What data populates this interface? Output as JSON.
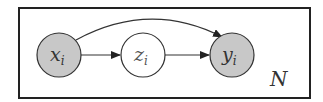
{
  "diagram": {
    "type": "plate-notation",
    "plate": {
      "label": "N"
    },
    "nodes": [
      {
        "id": "x",
        "label": "x",
        "subscript": "i",
        "observed": true
      },
      {
        "id": "z",
        "label": "z",
        "subscript": "i",
        "observed": false
      },
      {
        "id": "y",
        "label": "y",
        "subscript": "i",
        "observed": true
      }
    ],
    "edges": [
      {
        "from": "x",
        "to": "z"
      },
      {
        "from": "z",
        "to": "y"
      },
      {
        "from": "x",
        "to": "y",
        "curved": true
      }
    ],
    "colors": {
      "observed_fill": "#c8c8c8",
      "stroke": "#333333",
      "latent_fill": "#ffffff"
    }
  }
}
